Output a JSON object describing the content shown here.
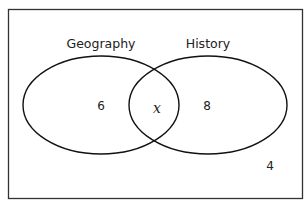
{
  "diagram": {
    "type": "venn",
    "sets": [
      {
        "id": "geography",
        "label": "Geography",
        "only_value": "6"
      },
      {
        "id": "history",
        "label": "History",
        "only_value": "8"
      }
    ],
    "intersection_value": "x",
    "outside_value": "4"
  }
}
